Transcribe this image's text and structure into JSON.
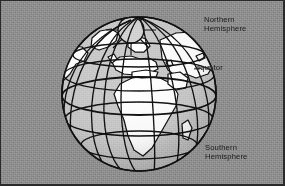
{
  "figure": {
    "background_color": "#8d8d8d",
    "frame_color": "#2a2a2a",
    "land_color": "#ffffff",
    "ocean_color": "#c9c9c9",
    "line_color": "#111111"
  },
  "labels": {
    "northern": "Northern\nHemisphere",
    "equator": "equator",
    "southern": "Southern\nHemisphere"
  },
  "globe": {
    "center_x": 139,
    "center_y": 94,
    "radius": 77,
    "pole_cap_label": "north-polar-cap",
    "graticule": {
      "parallels": [
        60,
        30,
        0,
        -30,
        -60
      ],
      "meridian_count": 9,
      "equator_latitude": 0
    },
    "continents": [
      "greenland",
      "north-america-edge",
      "europe",
      "africa",
      "arabia",
      "madagascar",
      "asia-edge"
    ]
  }
}
